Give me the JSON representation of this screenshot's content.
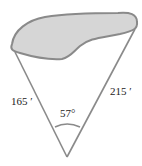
{
  "diagram": {
    "labels": {
      "left_side": "165 ′",
      "right_side": "215 ′",
      "angle": "57°"
    },
    "colors": {
      "region_fill": "#d6d6d6",
      "region_stroke": "#8a8a8a",
      "line_stroke": "#8a8a8a",
      "text": "#222222"
    }
  }
}
